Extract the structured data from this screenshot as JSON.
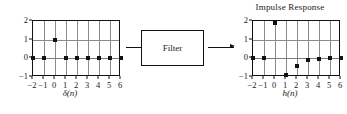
{
  "figure": {
    "caption_left": "δ(n)",
    "caption_right": "h(n)",
    "filter_label": "Filter",
    "arrow_in_name": "input-arrow",
    "arrow_out_name": "output-arrow"
  },
  "chart_data": [
    {
      "type": "scatter",
      "id": "input-signal",
      "title": "",
      "xlabel": "δ(n)",
      "ylabel": "",
      "x": [
        -2,
        -1,
        0,
        1,
        2,
        3,
        4,
        5,
        6
      ],
      "values": [
        0,
        0,
        1,
        0,
        0,
        0,
        0,
        0,
        0
      ],
      "xticklabels": [
        "−2",
        "−1",
        "0",
        "1",
        "2",
        "3",
        "4",
        "5",
        "6"
      ],
      "yticklabels": [
        "2",
        "1",
        "0",
        "−1"
      ],
      "yticks": [
        2,
        1,
        0,
        -1
      ],
      "xlim": [
        -2,
        6
      ],
      "ylim": [
        -1,
        2
      ],
      "grid": true,
      "legend": "none"
    },
    {
      "type": "scatter",
      "id": "impulse-response",
      "title": "Impulse Response",
      "xlabel": "h(n)",
      "ylabel": "",
      "x": [
        -2,
        -1,
        0,
        1,
        2,
        3,
        4,
        5,
        6
      ],
      "values": [
        0,
        0,
        1.9,
        -0.9,
        -0.4,
        -0.1,
        -0.05,
        0,
        0
      ],
      "xticklabels": [
        "−2",
        "−1",
        "0",
        "1",
        "2",
        "3",
        "4",
        "5",
        "6"
      ],
      "yticklabels": [
        "2",
        "1",
        "0",
        "−1"
      ],
      "yticks": [
        2,
        1,
        0,
        -1
      ],
      "xlim": [
        -2,
        6
      ],
      "ylim": [
        -1,
        2
      ],
      "grid": true,
      "legend": "none"
    }
  ],
  "colors": {
    "frame": "#111111",
    "grid": "#8c8c8c",
    "marker": "#111111",
    "background": "#ffffff"
  }
}
